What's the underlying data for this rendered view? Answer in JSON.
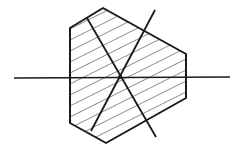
{
  "diagram": {
    "shape": "hexagonal section",
    "fill_pattern": "diagonal hatching",
    "colors": {
      "outline": "#1a1a1a",
      "hatch": "#6a6a6a",
      "background": "#ffffff"
    },
    "axes": [
      {
        "name": "horizontal-axis",
        "orientation": "horizontal"
      },
      {
        "name": "axis-a",
        "orientation": "diagonal descending"
      },
      {
        "name": "axis-b",
        "orientation": "diagonal ascending"
      }
    ],
    "labels": []
  }
}
